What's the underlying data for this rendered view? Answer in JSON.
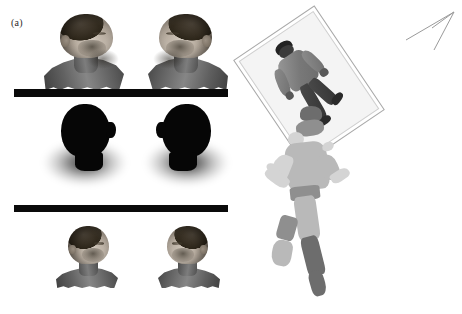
{
  "figure": {
    "type": "scientific-figure",
    "background_color": "#ffffff",
    "width": 462,
    "height": 314,
    "panels": [
      {
        "id": "a",
        "label": "(a)",
        "description": "Three rows of grayscale head reconstructions separated by solid black horizontal bars",
        "rows": [
          {
            "name": "textured-bust-row",
            "items": [
              {
                "name": "bust-left",
                "orientation": "facing-left",
                "style": "textured-grayscale"
              },
              {
                "name": "bust-right",
                "orientation": "facing-right",
                "style": "textured-grayscale"
              }
            ]
          },
          {
            "name": "silhouette-row",
            "items": [
              {
                "name": "silhouette-left",
                "orientation": "facing-left",
                "style": "black-silhouette-with-soft-shadow"
              },
              {
                "name": "silhouette-right",
                "orientation": "facing-right",
                "style": "black-silhouette-with-soft-shadow"
              }
            ]
          },
          {
            "name": "cropped-face-row",
            "items": [
              {
                "name": "face-left",
                "orientation": "facing-left",
                "style": "textured-grayscale"
              },
              {
                "name": "face-right",
                "orientation": "facing-right",
                "style": "textured-grayscale"
              }
            ]
          }
        ],
        "separators": [
          {
            "name": "separator-bar-1",
            "color": "#0a0a0a"
          },
          {
            "name": "separator-bar-2",
            "color": "#0a0a0a"
          }
        ]
      },
      {
        "id": "b",
        "label": "(b)",
        "description": "Tilted image plane containing a photograph of a walking person, a fragmented 3D point-cloud reconstruction of the same person, and a line-art viewing direction arrow",
        "elements": [
          {
            "name": "image-plane",
            "rotation_deg": -34,
            "border_color": "#a9a9a9",
            "fill_color": "#f4f4f4"
          },
          {
            "name": "photo-person",
            "pose": "walking",
            "style": "grayscale-photograph"
          },
          {
            "name": "reconstruction-point-cloud",
            "style": "fragmented-grayscale-surface"
          },
          {
            "name": "view-direction-arrow",
            "style": "thin-line-art",
            "color": "#909090"
          }
        ]
      }
    ]
  },
  "colors": {
    "background": "#ffffff",
    "bar": "#0a0a0a",
    "silhouette": "#060606",
    "plane_border": "#a9a9a9",
    "arrow": "#909090",
    "label_text": "#2b2b2b"
  }
}
